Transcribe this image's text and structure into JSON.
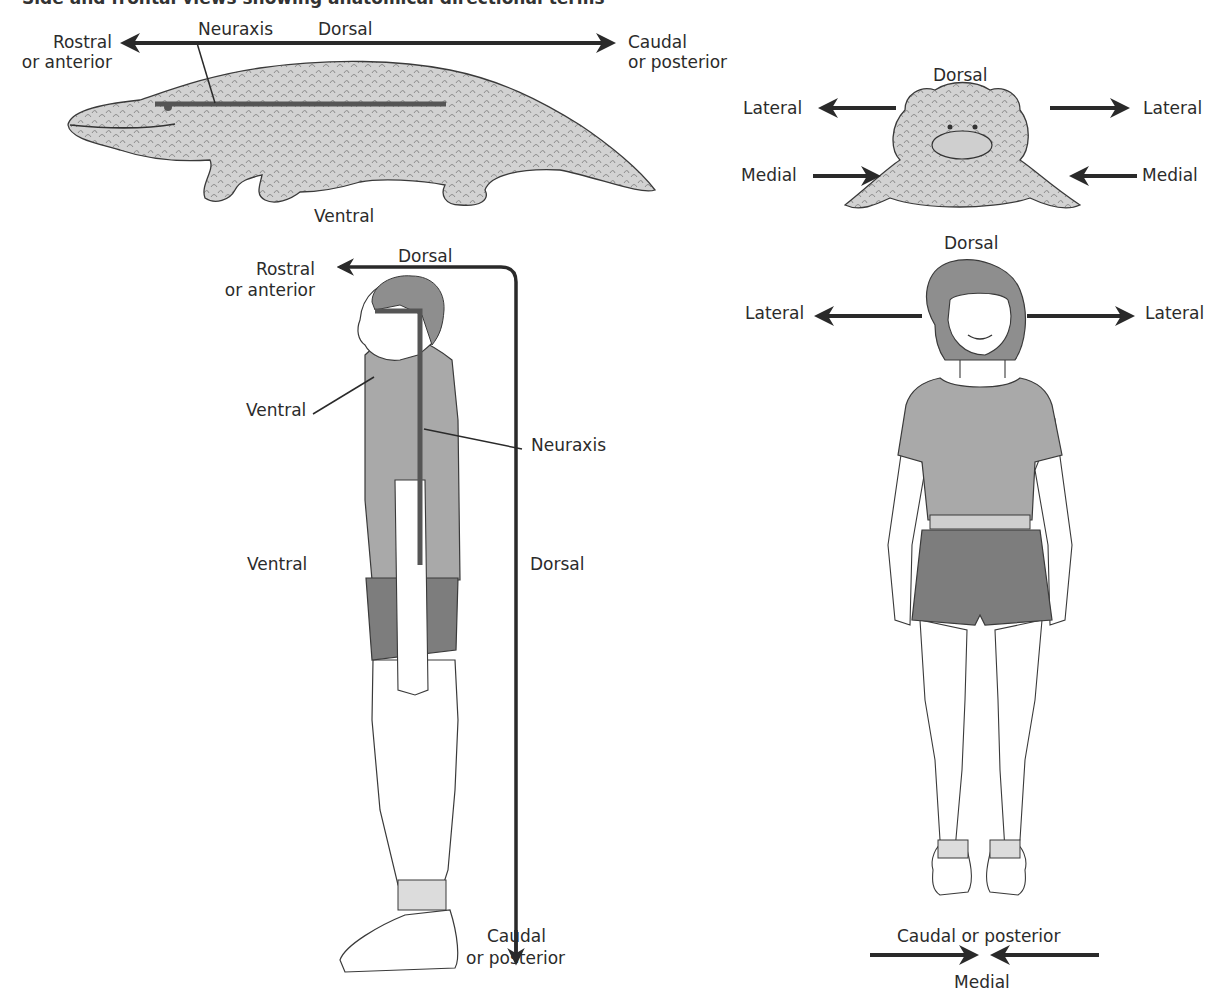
{
  "heading": "Side and frontal views showing anatomical directional terms",
  "colors": {
    "arrow": "#2a2a2a",
    "neuraxis": "#555555",
    "skin_fill": "#d2d2d2",
    "shirt_fill": "#a9a9a9",
    "shorts_fill": "#7d7d7d",
    "hair_fill": "#8e8e8e",
    "outline": "#3a3a3a"
  },
  "alligator_side": {
    "neuraxis": "Neuraxis",
    "dorsal": "Dorsal",
    "rostral": "Rostral",
    "rostral_sub": "or anterior",
    "caudal": "Caudal",
    "caudal_sub": "or posterior",
    "ventral": "Ventral"
  },
  "alligator_front": {
    "dorsal": "Dorsal",
    "lateral_left": "Lateral",
    "lateral_right": "Lateral",
    "medial_left": "Medial",
    "medial_right": "Medial"
  },
  "human_side": {
    "dorsal_top": "Dorsal",
    "rostral": "Rostral",
    "rostral_sub": "or anterior",
    "ventral_neck": "Ventral",
    "neuraxis": "Neuraxis",
    "ventral_body": "Ventral",
    "dorsal_back": "Dorsal",
    "caudal": "Caudal",
    "caudal_sub": "or posterior"
  },
  "human_front": {
    "dorsal": "Dorsal",
    "lateral_left": "Lateral",
    "lateral_right": "Lateral",
    "caudal": "Caudal or posterior",
    "medial": "Medial"
  }
}
